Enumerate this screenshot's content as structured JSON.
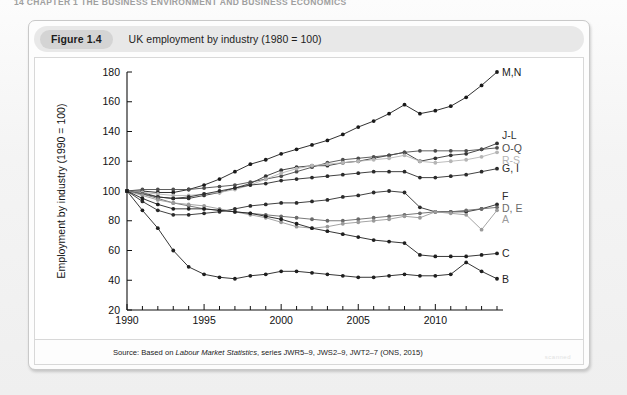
{
  "page": {
    "running_head": "14  CHAPTER 1  THE BUSINESS ENVIRONMENT AND BUSINESS ECONOMICS",
    "watermark": "scanned"
  },
  "figure": {
    "number_label": "Figure 1.4",
    "caption": "UK employment by industry (1980 = 100)",
    "source_prefix": "Source: Based on ",
    "source_italic": "Labour Market Statistics",
    "source_suffix": ", series JWR5–9, JWS2–9, JWT2–7 (ONS, 2015)"
  },
  "chart_data": {
    "type": "line",
    "title": "UK employment by industry (1980 = 100)",
    "xlabel": "",
    "ylabel": "Employment by industry (1990 = 100)",
    "xlim": [
      1990,
      2014
    ],
    "ylim": [
      20,
      180
    ],
    "yticks": [
      20,
      40,
      60,
      80,
      100,
      120,
      140,
      160,
      180
    ],
    "xticks_major": [
      1990,
      1995,
      2000,
      2005,
      2010
    ],
    "xticks_minor": [
      1991,
      1992,
      1993,
      1994,
      1996,
      1997,
      1998,
      1999,
      2001,
      2002,
      2003,
      2004,
      2006,
      2007,
      2008,
      2009,
      2011,
      2012,
      2013,
      2014
    ],
    "grid": false,
    "legend_position": "right-inline-labels",
    "markers": "filled-circle",
    "x": [
      1990,
      1991,
      1992,
      1993,
      1994,
      1995,
      1996,
      1997,
      1998,
      1999,
      2000,
      2001,
      2002,
      2003,
      2004,
      2005,
      2006,
      2007,
      2008,
      2009,
      2010,
      2011,
      2012,
      2013,
      2014
    ],
    "series": [
      {
        "name": "M,N",
        "label": "M,N",
        "color": "#1a1a1a",
        "values": [
          100,
          100,
          99,
          99,
          101,
          104,
          108,
          113,
          118,
          121,
          125,
          128,
          131,
          134,
          138,
          143,
          147,
          152,
          158,
          152,
          154,
          157,
          163,
          171,
          180
        ]
      },
      {
        "name": "J-L",
        "label": "J-L",
        "color": "#333333",
        "values": [
          100,
          99,
          96,
          95,
          95,
          97,
          99,
          102,
          105,
          110,
          114,
          116,
          117,
          117,
          119,
          120,
          122,
          124,
          126,
          120,
          122,
          124,
          125,
          128,
          132
        ]
      },
      {
        "name": "O-Q",
        "label": "O-Q",
        "color": "#4d4d4d",
        "values": [
          100,
          101,
          101,
          101,
          101,
          102,
          103,
          104,
          106,
          108,
          110,
          113,
          116,
          119,
          121,
          122,
          123,
          124,
          126,
          127,
          127,
          127,
          127,
          128,
          129
        ]
      },
      {
        "name": "R-S",
        "label": "R-S",
        "color": "#b5b5b5",
        "values": [
          100,
          99,
          98,
          97,
          97,
          98,
          99,
          101,
          104,
          108,
          112,
          115,
          117,
          118,
          119,
          120,
          121,
          122,
          124,
          120,
          119,
          120,
          121,
          123,
          126
        ]
      },
      {
        "name": "G, I",
        "label": "G, I",
        "color": "#2b2b2b",
        "values": [
          100,
          98,
          96,
          95,
          96,
          98,
          100,
          102,
          104,
          105,
          107,
          108,
          109,
          110,
          111,
          112,
          113,
          113,
          113,
          109,
          109,
          110,
          111,
          113,
          115
        ]
      },
      {
        "name": "F",
        "label": "F",
        "color": "#2b2b2b",
        "values": [
          100,
          93,
          87,
          84,
          84,
          85,
          86,
          88,
          90,
          91,
          92,
          92,
          93,
          94,
          96,
          97,
          99,
          100,
          99,
          89,
          86,
          86,
          86,
          88,
          91
        ]
      },
      {
        "name": "D, E",
        "label": "D, E",
        "color": "#6a6a6a",
        "values": [
          100,
          98,
          95,
          92,
          90,
          88,
          87,
          86,
          85,
          84,
          83,
          82,
          81,
          80,
          80,
          81,
          82,
          83,
          84,
          85,
          86,
          86,
          87,
          88,
          89
        ]
      },
      {
        "name": "A",
        "label": "A",
        "color": "#9a9a9a",
        "values": [
          100,
          97,
          94,
          92,
          91,
          90,
          88,
          86,
          84,
          82,
          79,
          76,
          75,
          76,
          78,
          79,
          80,
          81,
          83,
          82,
          86,
          85,
          84,
          74,
          87
        ]
      },
      {
        "name": "C",
        "label": "C",
        "color": "#1f1f1f",
        "values": [
          100,
          95,
          91,
          88,
          88,
          88,
          87,
          86,
          85,
          83,
          81,
          78,
          75,
          73,
          71,
          69,
          67,
          66,
          65,
          57,
          56,
          56,
          56,
          57,
          58
        ]
      },
      {
        "name": "B",
        "label": "B",
        "color": "#1f1f1f",
        "values": [
          100,
          87,
          75,
          60,
          49,
          44,
          42,
          41,
          43,
          44,
          46,
          46,
          45,
          44,
          43,
          42,
          42,
          43,
          44,
          43,
          43,
          44,
          52,
          46,
          41
        ]
      }
    ]
  }
}
